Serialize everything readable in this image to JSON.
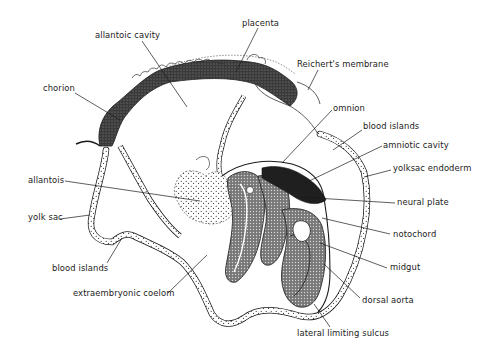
{
  "figure": {
    "ink_color": "#1a1a1a",
    "dense_tissue_color": "#2b2b2b",
    "background_color": "#ffffff"
  },
  "labels": [
    {
      "id": "placenta",
      "text": "placenta",
      "x": 242,
      "y": 18,
      "line": [
        [
          258,
          28
        ],
        [
          236,
          72
        ]
      ]
    },
    {
      "id": "allantoic-cavity",
      "text": "allantoic cavity",
      "x": 95,
      "y": 30,
      "line": [
        [
          142,
          41
        ],
        [
          187,
          107
        ]
      ]
    },
    {
      "id": "reicherts-membrane",
      "text": "Reichert's membrane",
      "x": 297,
      "y": 59,
      "line": [
        [
          318,
          70
        ],
        [
          308,
          90
        ]
      ]
    },
    {
      "id": "chorion",
      "text": "chorion",
      "x": 43,
      "y": 83,
      "line": [
        [
          75,
          93
        ],
        [
          120,
          120
        ]
      ]
    },
    {
      "id": "omnion",
      "text": "omnion",
      "x": 333,
      "y": 103,
      "line": [
        [
          332,
          110
        ],
        [
          282,
          163
        ]
      ]
    },
    {
      "id": "blood-islands-upper",
      "text": "blood islands",
      "x": 363,
      "y": 121,
      "line": [
        [
          362,
          130
        ],
        [
          333,
          150
        ]
      ]
    },
    {
      "id": "amniotic-cavity",
      "text": "amniotic cavity",
      "x": 383,
      "y": 140,
      "line": [
        [
          382,
          146
        ],
        [
          305,
          183
        ]
      ]
    },
    {
      "id": "yolk-sac-endoderm",
      "text": "yolksac endoderm",
      "x": 393,
      "y": 163,
      "line": [
        [
          391,
          170
        ],
        [
          364,
          177
        ]
      ]
    },
    {
      "id": "allantois",
      "text": "allantois",
      "x": 28,
      "y": 175,
      "line": [
        [
          65,
          181
        ],
        [
          200,
          201
        ]
      ]
    },
    {
      "id": "neural-plate",
      "text": "neural plate",
      "x": 397,
      "y": 197,
      "line": [
        [
          395,
          203
        ],
        [
          300,
          197
        ]
      ]
    },
    {
      "id": "yolk-sac",
      "text": "yolk sac",
      "x": 28,
      "y": 212,
      "line": [
        [
          60,
          219
        ],
        [
          90,
          215
        ]
      ]
    },
    {
      "id": "notochord",
      "text": "notochord",
      "x": 393,
      "y": 229,
      "line": [
        [
          390,
          234
        ],
        [
          322,
          218
        ]
      ]
    },
    {
      "id": "blood-islands-lower",
      "text": "blood islands",
      "x": 52,
      "y": 263,
      "line": [
        [
          107,
          263
        ],
        [
          122,
          238
        ]
      ]
    },
    {
      "id": "midgut",
      "text": "midgut",
      "x": 390,
      "y": 262,
      "line": [
        [
          387,
          268
        ],
        [
          320,
          243
        ]
      ]
    },
    {
      "id": "extraembryonic-coelom",
      "text": "extraembryonic coelom",
      "x": 73,
      "y": 288,
      "line": [
        [
          168,
          293
        ],
        [
          207,
          255
        ]
      ]
    },
    {
      "id": "dorsal-aorta",
      "text": "dorsal aorta",
      "x": 362,
      "y": 295,
      "line": [
        [
          360,
          298
        ],
        [
          324,
          264
        ]
      ]
    },
    {
      "id": "lateral-limiting-sulcus",
      "text": "lateral limiting sulcus",
      "x": 297,
      "y": 328,
      "line": [
        [
          330,
          327
        ],
        [
          314,
          304
        ]
      ]
    }
  ]
}
